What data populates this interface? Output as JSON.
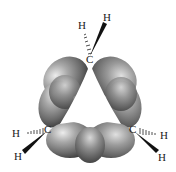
{
  "diagram": {
    "molecule": "cyclopropane",
    "style": "bent (banana) bond orbital overlap model",
    "atoms": {
      "carbons": [
        {
          "id": "C1",
          "label": "C",
          "x": 90,
          "y": 59
        },
        {
          "id": "C2",
          "label": "C",
          "x": 48,
          "y": 129
        },
        {
          "id": "C3",
          "label": "C",
          "x": 133,
          "y": 129
        }
      ],
      "hydrogens": [
        {
          "id": "H1a",
          "label": "H",
          "bonded_to": "C1",
          "bond": "hashed",
          "x": 82,
          "y": 26
        },
        {
          "id": "H1b",
          "label": "H",
          "bonded_to": "C1",
          "bond": "wedge",
          "x": 107,
          "y": 19
        },
        {
          "id": "H2a",
          "label": "H",
          "bonded_to": "C2",
          "bond": "hashed",
          "x": 16,
          "y": 137
        },
        {
          "id": "H2b",
          "label": "H",
          "bonded_to": "C2",
          "bond": "wedge",
          "x": 18,
          "y": 158
        },
        {
          "id": "H3a",
          "label": "H",
          "bonded_to": "C3",
          "bond": "hashed",
          "x": 164,
          "y": 138
        },
        {
          "id": "H3b",
          "label": "H",
          "bonded_to": "C3",
          "bond": "wedge",
          "x": 162,
          "y": 160
        }
      ]
    },
    "orbital_color": "#7a7a7a",
    "orbital_highlight": "#e6e6e6",
    "orbital_shadow": "#3a3a3a"
  }
}
